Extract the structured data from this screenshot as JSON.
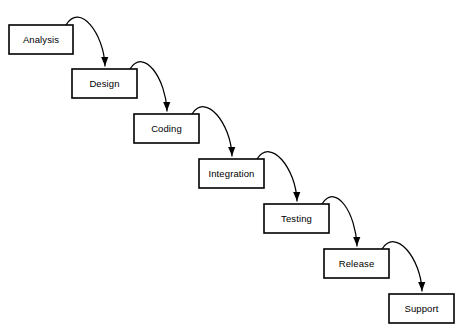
{
  "diagram": {
    "type": "waterfall-model",
    "background_color": "#ffffff",
    "stroke_color": "#000000",
    "box_fill_color": "#ffffff",
    "phases": [
      {
        "id": "analysis",
        "label": "Analysis",
        "x": 9,
        "y": 25,
        "width": 64,
        "height": 29
      },
      {
        "id": "design",
        "label": "Design",
        "x": 72,
        "y": 69,
        "width": 65,
        "height": 29
      },
      {
        "id": "coding",
        "label": "Coding",
        "x": 134,
        "y": 114,
        "width": 65,
        "height": 29
      },
      {
        "id": "integration",
        "label": "Integration",
        "x": 199,
        "y": 159,
        "width": 65,
        "height": 29
      },
      {
        "id": "testing",
        "label": "Testing",
        "x": 264,
        "y": 204,
        "width": 65,
        "height": 29
      },
      {
        "id": "release",
        "label": "Release",
        "x": 324,
        "y": 249,
        "width": 65,
        "height": 29
      },
      {
        "id": "support",
        "label": "Support",
        "x": 389,
        "y": 294,
        "width": 65,
        "height": 29
      }
    ],
    "arrows": [
      {
        "id": "analysis-to-design",
        "from": "analysis",
        "to": "design",
        "start_x": 66,
        "start_y": 25,
        "ctrl1_x": 80,
        "ctrl1_y": 2,
        "ctrl2_x": 104,
        "ctrl2_y": 34,
        "end_x": 105,
        "end_y": 66
      },
      {
        "id": "design-to-coding",
        "from": "design",
        "to": "coding",
        "start_x": 130,
        "start_y": 69,
        "ctrl1_x": 144,
        "ctrl1_y": 47,
        "ctrl2_x": 166,
        "ctrl2_y": 79,
        "end_x": 167,
        "end_y": 111
      },
      {
        "id": "coding-to-integration",
        "from": "coding",
        "to": "integration",
        "start_x": 192,
        "start_y": 114,
        "ctrl1_x": 206,
        "ctrl1_y": 92,
        "ctrl2_x": 231,
        "ctrl2_y": 124,
        "end_x": 232,
        "end_y": 156
      },
      {
        "id": "integration-to-testing",
        "from": "integration",
        "to": "testing",
        "start_x": 257,
        "start_y": 159,
        "ctrl1_x": 271,
        "ctrl1_y": 137,
        "ctrl2_x": 296,
        "ctrl2_y": 169,
        "end_x": 297,
        "end_y": 201
      },
      {
        "id": "testing-to-release",
        "from": "testing",
        "to": "release",
        "start_x": 322,
        "start_y": 204,
        "ctrl1_x": 336,
        "ctrl1_y": 182,
        "ctrl2_x": 356,
        "ctrl2_y": 214,
        "end_x": 357,
        "end_y": 246
      },
      {
        "id": "release-to-support",
        "from": "release",
        "to": "support",
        "start_x": 382,
        "start_y": 249,
        "ctrl1_x": 396,
        "ctrl1_y": 227,
        "ctrl2_x": 421,
        "ctrl2_y": 259,
        "end_x": 422,
        "end_y": 291
      }
    ]
  }
}
